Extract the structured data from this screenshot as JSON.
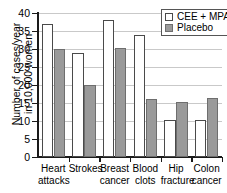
{
  "chart_data": {
    "type": "bar",
    "title": "",
    "xlabel": "",
    "ylabel_line1": "Number of cases/year",
    "ylabel_line2": "in 10,000 women",
    "ylim": [
      0,
      40
    ],
    "yticks": [
      0,
      5,
      10,
      15,
      20,
      25,
      30,
      35,
      40
    ],
    "ytick_labels": [
      "0",
      "5",
      "10",
      "15",
      "20",
      "25",
      "30",
      "35",
      "40"
    ],
    "grid": true,
    "legend_position": "top-right",
    "categories": [
      "Heart attacks",
      "Strokes",
      "Breast cancer",
      "Blood clots",
      "Hip fracture",
      "Colon cancer"
    ],
    "category_lines": [
      [
        "Heart",
        "attacks"
      ],
      [
        "Strokes",
        ""
      ],
      [
        "Breast",
        "cancer"
      ],
      [
        "Blood",
        "clots"
      ],
      [
        "Hip",
        "fracture"
      ],
      [
        "Colon",
        "cancer"
      ]
    ],
    "series": [
      {
        "name": "CEE + MPA",
        "style": "open",
        "color": "#ffffff",
        "edge_color": "#4a4a4a",
        "values": [
          37,
          29,
          38,
          34,
          10.2,
          10.2
        ]
      },
      {
        "name": "Placebo",
        "style": "filled",
        "color": "#9a9a9a",
        "edge_color": "#6e6e6e",
        "values": [
          30,
          20,
          30.3,
          16.2,
          15.2,
          16.3
        ]
      }
    ]
  },
  "legend": {
    "items": [
      {
        "label": "CEE + MPA",
        "style": "open"
      },
      {
        "label": "Placebo",
        "style": "filled"
      }
    ]
  },
  "colors": {
    "axis": "#1a1a1a",
    "grid": "#c9c9c9",
    "placebo_fill": "#9a9a9a",
    "cee_fill": "#ffffff",
    "background": "#ffffff"
  }
}
